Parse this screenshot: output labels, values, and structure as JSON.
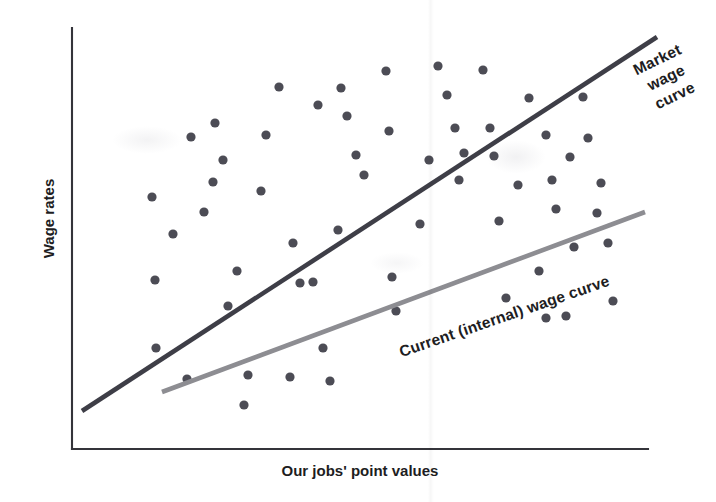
{
  "chart_data": {
    "type": "scatter",
    "title": "",
    "subtitle": "",
    "xlabel": "Our jobs' point values",
    "ylabel": "Wage rates",
    "xlim": [
      0,
      100
    ],
    "ylim": [
      0,
      100
    ],
    "grid": false,
    "axis_ticks": "none",
    "legend_position": "inline-annotations",
    "annotations": [
      {
        "name": "market-wage-curve-label",
        "text": "Market wage curve",
        "lines": [
          "Market",
          "wage",
          "curve"
        ],
        "rotation_deg": -26
      },
      {
        "name": "current-internal-wage-curve-label",
        "text": "Current (internal) wage curve",
        "lines": [
          "Current (internal) wage curve"
        ],
        "rotation_deg": -19
      }
    ],
    "series": [
      {
        "name": "Job data points",
        "type": "scatter",
        "marker": "filled-circle",
        "color": "#4c4c55",
        "marker_radius_px": 4.6,
        "points_px": [
          [
            152,
            197
          ],
          [
            155,
            280
          ],
          [
            156,
            348
          ],
          [
            173,
            234
          ],
          [
            187,
            379
          ],
          [
            191,
            137
          ],
          [
            204,
            212
          ],
          [
            213,
            182
          ],
          [
            215,
            123
          ],
          [
            223,
            160
          ],
          [
            228,
            306
          ],
          [
            237,
            271
          ],
          [
            244,
            405
          ],
          [
            248,
            375
          ],
          [
            261,
            191
          ],
          [
            266,
            135
          ],
          [
            279,
            87
          ],
          [
            290,
            377
          ],
          [
            293,
            243
          ],
          [
            300,
            283
          ],
          [
            313,
            282
          ],
          [
            318,
            105
          ],
          [
            323,
            348
          ],
          [
            330,
            381
          ],
          [
            338,
            230
          ],
          [
            341,
            88
          ],
          [
            347,
            116
          ],
          [
            356,
            155
          ],
          [
            364,
            175
          ],
          [
            386,
            71
          ],
          [
            389,
            131
          ],
          [
            392,
            277
          ],
          [
            396,
            311
          ],
          [
            420,
            224
          ],
          [
            429,
            160
          ],
          [
            438,
            66
          ],
          [
            447,
            95
          ],
          [
            455,
            128
          ],
          [
            459,
            180
          ],
          [
            464,
            153
          ],
          [
            483,
            70
          ],
          [
            490,
            128
          ],
          [
            494,
            156
          ],
          [
            499,
            221
          ],
          [
            506,
            298
          ],
          [
            518,
            185
          ],
          [
            529,
            98
          ],
          [
            539,
            271
          ],
          [
            546,
            135
          ],
          [
            552,
            180
          ],
          [
            556,
            209
          ],
          [
            566,
            316
          ],
          [
            570,
            157
          ],
          [
            574,
            247
          ],
          [
            583,
            97
          ],
          [
            588,
            138
          ],
          [
            597,
            213
          ],
          [
            601,
            183
          ],
          [
            608,
            243
          ],
          [
            613,
            301
          ],
          [
            546,
            318
          ]
        ]
      },
      {
        "name": "Market wage curve",
        "type": "line",
        "color": "#3e3e47",
        "stroke_width_px": 4.6,
        "endpoints_px": [
          [
            82,
            411
          ],
          [
            657,
            37
          ]
        ],
        "description": "Steeper upper trend line representing external market pay rates"
      },
      {
        "name": "Current (internal) wage curve",
        "type": "line",
        "color": "#8d8d92",
        "stroke_width_px": 4.6,
        "endpoints_px": [
          [
            162,
            392
          ],
          [
            645,
            212
          ]
        ],
        "description": "Shallower lower trend line representing the organization's existing internal pay structure"
      }
    ],
    "axes_px": {
      "y_axis": [
        [
          72,
          28
        ],
        [
          72,
          449
        ]
      ],
      "x_axis": [
        [
          72,
          449
        ],
        [
          648,
          449
        ]
      ],
      "color": "#34343a"
    }
  },
  "colors": {
    "background": "#ffffff",
    "axis": "#34343a",
    "dot": "#4c4c55",
    "market_line": "#3e3e47",
    "internal_line": "#8d8d92",
    "label_text": "#1d1d22"
  },
  "labels": {
    "y_axis": "Wage rates",
    "x_axis": "Our jobs' point values",
    "market_line_1": "Market",
    "market_line_2": "wage",
    "market_line_3": "curve",
    "internal_line": "Current (internal) wage curve"
  }
}
